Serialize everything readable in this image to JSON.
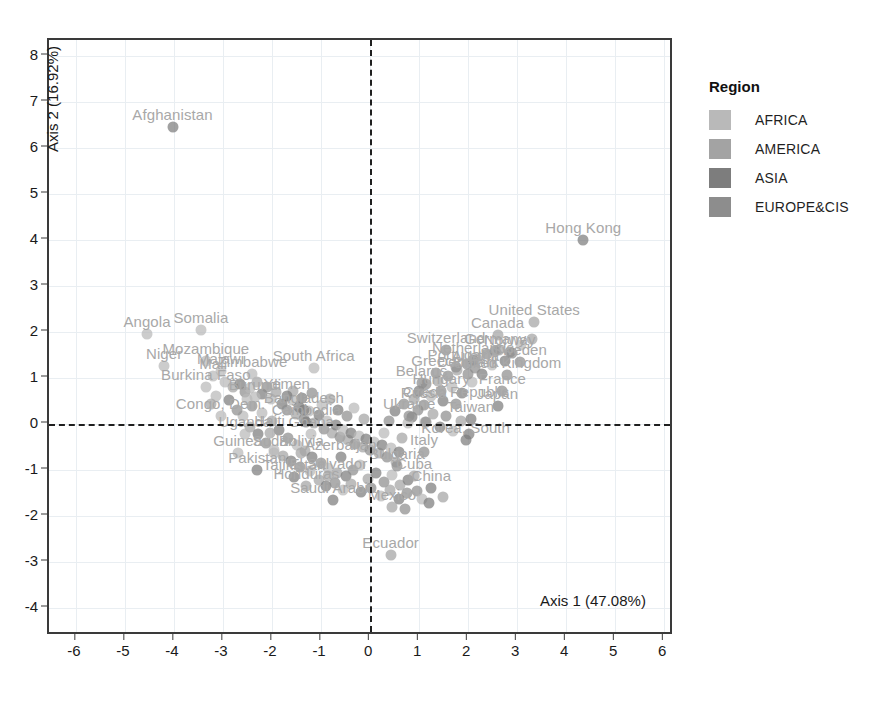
{
  "chart_data": {
    "type": "scatter",
    "title": "",
    "xlabel": "Axis 1 (47.08%)",
    "ylabel": "Axis 2 (16.92%)",
    "xlim": [
      -6.55,
      6.2
    ],
    "ylim": [
      -4.6,
      8.35
    ],
    "xticks": [
      -6,
      -5,
      -4,
      -3,
      -2,
      -1,
      0,
      1,
      2,
      3,
      4,
      5,
      6
    ],
    "yticks": [
      -4,
      -3,
      -2,
      -1,
      0,
      1,
      2,
      3,
      4,
      5,
      6,
      7,
      8
    ],
    "grid": true,
    "reference_lines": {
      "vertical_at_x": 0,
      "horizontal_at_y": 0,
      "style": "dashed"
    },
    "legend": {
      "title": "Region",
      "position": "right",
      "entries": [
        {
          "label": "AFRICA",
          "color": "#b9b9b9"
        },
        {
          "label": "AMERICA",
          "color": "#a3a3a3"
        },
        {
          "label": "ASIA",
          "color": "#7d7d7d"
        },
        {
          "label": "EUROPE&CIS",
          "color": "#8d8d8d"
        }
      ]
    },
    "points": [
      {
        "label": "Afghanistan",
        "x": -4.03,
        "y": 6.45,
        "region": "ASIA"
      },
      {
        "label": "Hong Kong",
        "x": 4.35,
        "y": 4.0,
        "region": "ASIA"
      },
      {
        "label": "Angola",
        "x": -4.55,
        "y": 1.97,
        "region": "AFRICA"
      },
      {
        "label": "Somalia",
        "x": -3.45,
        "y": 2.05,
        "region": "AFRICA"
      },
      {
        "label": "Mozambique",
        "x": -3.35,
        "y": 1.38,
        "region": "AFRICA"
      },
      {
        "label": "Niger",
        "x": -4.2,
        "y": 1.26,
        "region": "AFRICA"
      },
      {
        "label": "Malawi",
        "x": -3.05,
        "y": 1.16,
        "region": "AFRICA"
      },
      {
        "label": "Mali",
        "x": -3.2,
        "y": 1.05,
        "region": "AFRICA"
      },
      {
        "label": "Zimbabwe",
        "x": -2.4,
        "y": 1.1,
        "region": "AFRICA"
      },
      {
        "label": "Burkina Faso",
        "x": -3.35,
        "y": 0.8,
        "region": "AFRICA"
      },
      {
        "label": "South Africa",
        "x": -1.15,
        "y": 1.22,
        "region": "AFRICA"
      },
      {
        "label": "Burundi",
        "x": -2.35,
        "y": 0.6,
        "region": "AFRICA"
      },
      {
        "label": "Yemen",
        "x": -1.7,
        "y": 0.62,
        "region": "ASIA"
      },
      {
        "label": "Congo, Dem.",
        "x": -3.05,
        "y": 0.18,
        "region": "AFRICA"
      },
      {
        "label": "Bangladesh",
        "x": -1.35,
        "y": 0.3,
        "region": "ASIA"
      },
      {
        "label": "Cambodia",
        "x": -1.3,
        "y": 0.05,
        "region": "ASIA"
      },
      {
        "label": "Uganda",
        "x": -2.55,
        "y": -0.22,
        "region": "AFRICA"
      },
      {
        "label": "Haiti",
        "x": -2.05,
        "y": -0.2,
        "region": "AMERICA"
      },
      {
        "label": "Ghana",
        "x": -1.2,
        "y": -0.22,
        "region": "AFRICA"
      },
      {
        "label": "Guinea",
        "x": -2.7,
        "y": -0.62,
        "region": "AFRICA"
      },
      {
        "label": "Sudan",
        "x": -1.95,
        "y": -0.62,
        "region": "AFRICA"
      },
      {
        "label": "Bolivia",
        "x": -1.4,
        "y": -0.62,
        "region": "AMERICA"
      },
      {
        "label": "Azerbaijan",
        "x": -0.6,
        "y": -0.7,
        "region": "ASIA"
      },
      {
        "label": "Pakistan",
        "x": -2.3,
        "y": -1.0,
        "region": "ASIA"
      },
      {
        "label": "Tajikistan",
        "x": -1.55,
        "y": -1.15,
        "region": "ASIA"
      },
      {
        "label": "El Salvador",
        "x": -0.85,
        "y": -1.12,
        "region": "AMERICA"
      },
      {
        "label": "Honduras",
        "x": -1.3,
        "y": -1.35,
        "region": "AMERICA"
      },
      {
        "label": "Saudi Arabia",
        "x": -0.75,
        "y": -1.65,
        "region": "ASIA"
      },
      {
        "label": "Cuba",
        "x": 0.9,
        "y": -1.12,
        "region": "AMERICA"
      },
      {
        "label": "China",
        "x": 1.25,
        "y": -1.38,
        "region": "ASIA"
      },
      {
        "label": "Mexico",
        "x": 0.45,
        "y": -1.8,
        "region": "AMERICA"
      },
      {
        "label": "Ecuador",
        "x": 0.42,
        "y": -2.85,
        "region": "AMERICA"
      },
      {
        "label": "United States",
        "x": 3.35,
        "y": 2.22,
        "region": "AMERICA"
      },
      {
        "label": "Canada",
        "x": 2.6,
        "y": 1.95,
        "region": "AMERICA"
      },
      {
        "label": "Switzerland",
        "x": 1.55,
        "y": 1.62,
        "region": "EUROPE&CIS"
      },
      {
        "label": "Germany",
        "x": 2.55,
        "y": 1.6,
        "region": "EUROPE&CIS"
      },
      {
        "label": "Norway",
        "x": 2.85,
        "y": 1.58,
        "region": "EUROPE&CIS"
      },
      {
        "label": "Netherlands",
        "x": 2.1,
        "y": 1.4,
        "region": "EUROPE&CIS"
      },
      {
        "label": "Sweden",
        "x": 3.05,
        "y": 1.35,
        "region": "EUROPE&CIS"
      },
      {
        "label": "Portugal",
        "x": 1.75,
        "y": 1.25,
        "region": "EUROPE&CIS"
      },
      {
        "label": "Austria",
        "x": 2.15,
        "y": 1.22,
        "region": "EUROPE&CIS"
      },
      {
        "label": "Greece",
        "x": 1.35,
        "y": 1.12,
        "region": "EUROPE&CIS"
      },
      {
        "label": "Denmark",
        "x": 2.0,
        "y": 1.1,
        "region": "EUROPE&CIS"
      },
      {
        "label": "United Kingdom",
        "x": 2.8,
        "y": 1.08,
        "region": "EUROPE&CIS"
      },
      {
        "label": "Belarus",
        "x": 1.05,
        "y": 0.9,
        "region": "EUROPE&CIS"
      },
      {
        "label": "Hungary",
        "x": 1.45,
        "y": 0.72,
        "region": "EUROPE&CIS"
      },
      {
        "label": "France",
        "x": 2.7,
        "y": 0.72,
        "region": "EUROPE&CIS"
      },
      {
        "label": "Czech Republic",
        "x": 1.75,
        "y": 0.45,
        "region": "EUROPE&CIS"
      },
      {
        "label": "Russia",
        "x": 1.1,
        "y": 0.42,
        "region": "EUROPE&CIS"
      },
      {
        "label": "Japan",
        "x": 2.6,
        "y": 0.4,
        "region": "ASIA"
      },
      {
        "label": "Ukraine",
        "x": 0.8,
        "y": 0.18,
        "region": "EUROPE&CIS"
      },
      {
        "label": "Taiwan",
        "x": 2.05,
        "y": 0.12,
        "region": "ASIA"
      },
      {
        "label": "Switzerland2",
        "x": 1.15,
        "y": 0.05,
        "region": "EUROPE&CIS"
      },
      {
        "label": "Korea, South",
        "x": 1.95,
        "y": -0.35,
        "region": "ASIA"
      },
      {
        "label": "Italy",
        "x": 1.1,
        "y": -0.6,
        "region": "EUROPE&CIS"
      },
      {
        "label": "Bulgaria",
        "x": 0.55,
        "y": -0.9,
        "region": "EUROPE&CIS"
      }
    ],
    "cloud_points": [
      {
        "x": -2.95,
        "y": 0.92
      },
      {
        "x": -2.8,
        "y": 0.8
      },
      {
        "x": -2.65,
        "y": 0.88
      },
      {
        "x": -2.55,
        "y": 0.7
      },
      {
        "x": -2.45,
        "y": 0.78
      },
      {
        "x": -2.3,
        "y": 0.92
      },
      {
        "x": -2.2,
        "y": 0.66
      },
      {
        "x": -2.1,
        "y": 0.8
      },
      {
        "x": -2.02,
        "y": 0.55
      },
      {
        "x": -1.92,
        "y": 0.7
      },
      {
        "x": -1.8,
        "y": 0.45
      },
      {
        "x": -1.7,
        "y": 0.3
      },
      {
        "x": -1.6,
        "y": 0.52
      },
      {
        "x": -1.52,
        "y": 0.22
      },
      {
        "x": -1.45,
        "y": 0.38
      },
      {
        "x": -1.35,
        "y": 0.12
      },
      {
        "x": -1.25,
        "y": 0.28
      },
      {
        "x": -1.15,
        "y": 0.02
      },
      {
        "x": -1.05,
        "y": 0.2
      },
      {
        "x": -0.95,
        "y": -0.1
      },
      {
        "x": -0.88,
        "y": 0.08
      },
      {
        "x": -0.78,
        "y": -0.2
      },
      {
        "x": -0.7,
        "y": -0.02
      },
      {
        "x": -0.62,
        "y": -0.28
      },
      {
        "x": -0.55,
        "y": -0.12
      },
      {
        "x": -0.45,
        "y": -0.35
      },
      {
        "x": -0.38,
        "y": -0.18
      },
      {
        "x": -0.3,
        "y": -0.42
      },
      {
        "x": -0.22,
        "y": -0.25
      },
      {
        "x": -0.15,
        "y": -0.5
      },
      {
        "x": -0.08,
        "y": -0.32
      },
      {
        "x": 0.0,
        "y": -0.55
      },
      {
        "x": 0.08,
        "y": -0.38
      },
      {
        "x": 0.18,
        "y": -0.62
      },
      {
        "x": 0.25,
        "y": -0.45
      },
      {
        "x": 0.35,
        "y": -0.72
      },
      {
        "x": 0.42,
        "y": -0.52
      },
      {
        "x": 0.52,
        "y": -0.82
      },
      {
        "x": 0.6,
        "y": -0.6
      },
      {
        "x": -2.4,
        "y": 0.4
      },
      {
        "x": -2.2,
        "y": 0.25
      },
      {
        "x": -2.0,
        "y": 0.08
      },
      {
        "x": -1.85,
        "y": -0.12
      },
      {
        "x": -1.68,
        "y": -0.3
      },
      {
        "x": -1.5,
        "y": -0.45
      },
      {
        "x": -1.32,
        "y": -0.58
      },
      {
        "x": -1.18,
        "y": -0.72
      },
      {
        "x": -1.0,
        "y": -0.85
      },
      {
        "x": -0.85,
        "y": -0.95
      },
      {
        "x": -0.68,
        "y": -1.05
      },
      {
        "x": -0.5,
        "y": -1.12
      },
      {
        "x": -0.35,
        "y": -1.0
      },
      {
        "x": -0.2,
        "y": -0.88
      },
      {
        "x": -0.05,
        "y": -1.18
      },
      {
        "x": 0.12,
        "y": -1.05
      },
      {
        "x": 0.28,
        "y": -1.25
      },
      {
        "x": 0.45,
        "y": -1.1
      },
      {
        "x": 0.62,
        "y": -1.32
      },
      {
        "x": 0.78,
        "y": -1.2
      },
      {
        "x": 0.95,
        "y": -1.45
      },
      {
        "x": -2.6,
        "y": 0.18
      },
      {
        "x": -2.45,
        "y": -0.05
      },
      {
        "x": -2.28,
        "y": -0.22
      },
      {
        "x": -2.12,
        "y": -0.4
      },
      {
        "x": -1.95,
        "y": -0.55
      },
      {
        "x": -1.78,
        "y": -0.68
      },
      {
        "x": -1.62,
        "y": -0.8
      },
      {
        "x": -1.42,
        "y": -0.92
      },
      {
        "x": -1.22,
        "y": -1.02
      },
      {
        "x": -1.05,
        "y": -1.22
      },
      {
        "x": -0.9,
        "y": -1.35
      },
      {
        "x": -0.72,
        "y": -1.28
      },
      {
        "x": -0.55,
        "y": -1.42
      },
      {
        "x": -0.38,
        "y": -1.3
      },
      {
        "x": -0.18,
        "y": -1.48
      },
      {
        "x": 0.02,
        "y": -1.38
      },
      {
        "x": 0.22,
        "y": -1.55
      },
      {
        "x": 0.4,
        "y": -1.42
      },
      {
        "x": 0.58,
        "y": -1.62
      },
      {
        "x": 0.75,
        "y": -1.5
      },
      {
        "x": 1.05,
        "y": -1.62
      },
      {
        "x": 0.9,
        "y": 0.55
      },
      {
        "x": 1.0,
        "y": 0.72
      },
      {
        "x": 1.15,
        "y": 0.88
      },
      {
        "x": 1.25,
        "y": 0.62
      },
      {
        "x": 1.38,
        "y": 0.95
      },
      {
        "x": 1.48,
        "y": 0.5
      },
      {
        "x": 1.58,
        "y": 1.05
      },
      {
        "x": 1.68,
        "y": 0.8
      },
      {
        "x": 1.78,
        "y": 1.18
      },
      {
        "x": 1.88,
        "y": 0.68
      },
      {
        "x": 1.98,
        "y": 1.3
      },
      {
        "x": 2.08,
        "y": 0.92
      },
      {
        "x": 2.18,
        "y": 1.42
      },
      {
        "x": 2.28,
        "y": 1.1
      },
      {
        "x": 2.38,
        "y": 1.52
      },
      {
        "x": 2.48,
        "y": 1.28
      },
      {
        "x": 2.62,
        "y": 1.62
      },
      {
        "x": 2.75,
        "y": 1.38
      },
      {
        "x": 2.9,
        "y": 1.55
      },
      {
        "x": 3.08,
        "y": 1.72
      },
      {
        "x": 3.3,
        "y": 1.85
      },
      {
        "x": 0.85,
        "y": 0.15
      },
      {
        "x": 0.98,
        "y": 0.32
      },
      {
        "x": 1.12,
        "y": 0.05
      },
      {
        "x": 1.28,
        "y": 0.22
      },
      {
        "x": 1.42,
        "y": -0.05
      },
      {
        "x": 1.55,
        "y": 0.18
      },
      {
        "x": 1.7,
        "y": -0.15
      },
      {
        "x": 1.85,
        "y": 0.08
      },
      {
        "x": 2.02,
        "y": -0.22
      },
      {
        "x": 0.7,
        "y": 0.45
      },
      {
        "x": 0.78,
        "y": 0.02
      },
      {
        "x": 0.65,
        "y": -0.3
      },
      {
        "x": 0.5,
        "y": 0.28
      },
      {
        "x": 0.38,
        "y": 0.08
      },
      {
        "x": 0.28,
        "y": -0.18
      },
      {
        "x": 1.48,
        "y": -1.58
      },
      {
        "x": 1.2,
        "y": -1.72
      },
      {
        "x": 0.72,
        "y": -1.85
      },
      {
        "x": -3.15,
        "y": 0.62
      },
      {
        "x": -3.25,
        "y": 0.45
      },
      {
        "x": -2.88,
        "y": 0.52
      },
      {
        "x": -2.72,
        "y": 0.32
      },
      {
        "x": -2.52,
        "y": 0.55
      },
      {
        "x": -1.58,
        "y": 0.72
      },
      {
        "x": -1.38,
        "y": 0.58
      },
      {
        "x": -1.18,
        "y": 0.68
      },
      {
        "x": -0.98,
        "y": 0.42
      },
      {
        "x": -0.82,
        "y": 0.55
      },
      {
        "x": -0.65,
        "y": 0.32
      },
      {
        "x": -0.48,
        "y": 0.18
      },
      {
        "x": -0.32,
        "y": 0.35
      },
      {
        "x": -0.12,
        "y": 0.12
      }
    ]
  },
  "legend": {
    "title": "Region",
    "items": [
      {
        "label": "AFRICA",
        "color": "#b9b9b9"
      },
      {
        "label": "AMERICA",
        "color": "#a3a3a3"
      },
      {
        "label": "ASIA",
        "color": "#7d7d7d"
      },
      {
        "label": "EUROPE&CIS",
        "color": "#8d8d8d"
      }
    ]
  }
}
